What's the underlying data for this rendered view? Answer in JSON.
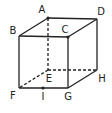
{
  "diagram": {
    "type": "cube",
    "vertices": {
      "A": {
        "x": 48,
        "y": 18,
        "label": "A",
        "lx": 42,
        "ly": 10,
        "dot": true
      },
      "B": {
        "x": 19,
        "y": 36,
        "label": "B",
        "lx": 13,
        "ly": 31,
        "dot": false
      },
      "C": {
        "x": 68,
        "y": 37,
        "label": "C",
        "lx": 65,
        "ly": 30,
        "dot": true
      },
      "D": {
        "x": 97,
        "y": 19,
        "label": "D",
        "lx": 101,
        "ly": 12,
        "dot": false
      },
      "E": {
        "x": 48,
        "y": 70,
        "label": "E",
        "lx": 49,
        "ly": 79,
        "dot": false
      },
      "F": {
        "x": 19,
        "y": 88,
        "label": "F",
        "lx": 13,
        "ly": 96,
        "dot": false
      },
      "G": {
        "x": 68,
        "y": 88,
        "label": "G",
        "lx": 68,
        "ly": 97,
        "dot": false
      },
      "H": {
        "x": 97,
        "y": 70,
        "label": "H",
        "lx": 102,
        "ly": 79,
        "dot": false
      },
      "I": {
        "x": 43,
        "y": 88,
        "label": "I",
        "lx": 43,
        "ly": 97,
        "dot": true
      }
    },
    "solid_edges": [
      [
        "A",
        "B"
      ],
      [
        "A",
        "D"
      ],
      [
        "B",
        "C"
      ],
      [
        "C",
        "D"
      ],
      [
        "B",
        "F"
      ],
      [
        "C",
        "G"
      ],
      [
        "D",
        "H"
      ],
      [
        "F",
        "G"
      ],
      [
        "G",
        "H"
      ]
    ],
    "dashed_edges": [
      [
        "A",
        "E"
      ],
      [
        "E",
        "F"
      ],
      [
        "E",
        "H"
      ]
    ],
    "colors": {
      "line": "#222222",
      "background": "#ffffff"
    }
  }
}
